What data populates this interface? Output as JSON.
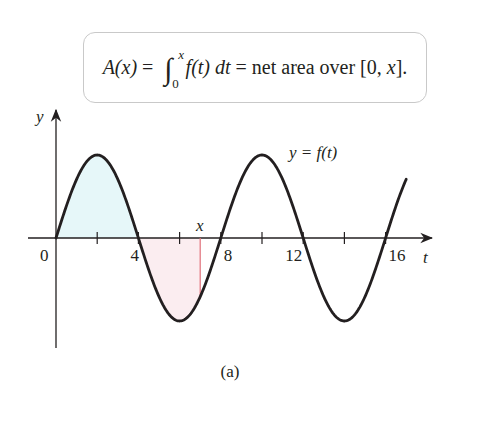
{
  "formula": {
    "lhs": "A(x)",
    "eq1": " = ",
    "integral_sign": "∫",
    "upper_limit": "x",
    "lower_limit": "0",
    "integrand": "f(t) dt",
    "eq2": " = ",
    "rhs": "net area over [0, ",
    "rhs_var": "x",
    "rhs_end": "]."
  },
  "labels": {
    "y_axis": "y",
    "t_axis": "t",
    "origin": "0",
    "curve": "y = f(t)",
    "x_marker": "x",
    "caption": "(a)"
  },
  "colors": {
    "curve": "#231f20",
    "axis": "#231f20",
    "positive_fill": "#e6f7f9",
    "negative_fill": "#fbedf0",
    "marker_line": "#e0707a",
    "box_border": "#c9c9c9"
  },
  "chart_data": {
    "type": "line",
    "xlabel": "t",
    "ylabel": "y",
    "x_ticks": [
      2,
      4,
      6,
      8,
      10,
      12,
      14,
      16
    ],
    "x_tick_labels": [
      {
        "t": 0,
        "label": "0"
      },
      {
        "t": 4,
        "label": "4"
      },
      {
        "t": 8,
        "label": "8"
      },
      {
        "t": 12,
        "label": "12"
      },
      {
        "t": 16,
        "label": "16"
      }
    ],
    "xlim": [
      0,
      18.5
    ],
    "ylim": [
      -1.3,
      1.55
    ],
    "grid": false,
    "legend": "none",
    "series": [
      {
        "name": "y = f(t)",
        "function": "sin(pi*t/4)",
        "t_range": [
          0,
          17.0
        ],
        "amplitude": 1,
        "period": 8,
        "zeros": [
          0,
          4,
          8,
          12,
          16
        ],
        "maxima": [
          2,
          10
        ],
        "minima": [
          6,
          14
        ],
        "x": [
          0,
          1,
          2,
          3,
          4,
          5,
          6,
          7,
          8,
          9,
          10,
          11,
          12,
          13,
          14,
          15,
          16,
          17
        ],
        "y": [
          0,
          0.71,
          1,
          0.71,
          0,
          -0.71,
          -1,
          -0.71,
          0,
          0.71,
          1,
          0.71,
          0,
          -0.71,
          -1,
          -0.71,
          0,
          0.71
        ]
      }
    ],
    "shaded_regions": [
      {
        "from": 0,
        "to": 4,
        "sign": "positive",
        "color": "light cyan"
      },
      {
        "from": 4,
        "to": 7.0,
        "sign": "negative",
        "color": "light pink"
      }
    ],
    "annotations": [
      {
        "type": "vertical_line",
        "t": 7.0,
        "label": "x",
        "color": "red"
      },
      {
        "type": "text",
        "text": "y = f(t)",
        "near_t": 11.5
      },
      {
        "type": "caption",
        "text": "(a)"
      }
    ]
  }
}
